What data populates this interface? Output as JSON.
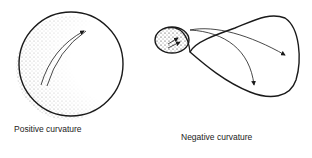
{
  "figures": [
    {
      "id": "positive",
      "label": "Positive curvature",
      "shape": "sphere"
    },
    {
      "id": "negative",
      "label": "Negative curvature",
      "shape": "saddle"
    }
  ],
  "colors": {
    "ink": "#1a1a1a",
    "background": "#ffffff"
  }
}
